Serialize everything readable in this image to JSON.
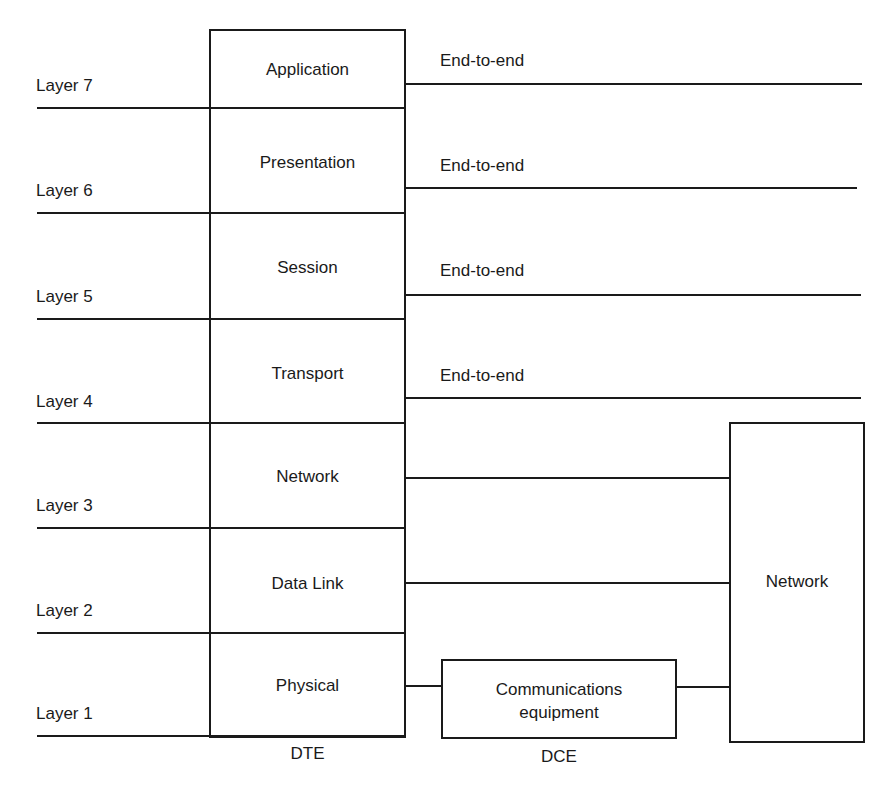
{
  "diagram": {
    "type": "OSI reference model",
    "dte": {
      "label": "DTE",
      "layers": [
        {
          "number": 7,
          "side_label": "Layer 7",
          "name": "Application",
          "connection": "End-to-end"
        },
        {
          "number": 6,
          "side_label": "Layer 6",
          "name": "Presentation",
          "connection": "End-to-end"
        },
        {
          "number": 5,
          "side_label": "Layer 5",
          "name": "Session",
          "connection": "End-to-end"
        },
        {
          "number": 4,
          "side_label": "Layer 4",
          "name": "Transport",
          "connection": "End-to-end"
        },
        {
          "number": 3,
          "side_label": "Layer 3",
          "name": "Network",
          "connection": "to Network"
        },
        {
          "number": 2,
          "side_label": "Layer 2",
          "name": "Data Link",
          "connection": "to Network"
        },
        {
          "number": 1,
          "side_label": "Layer 1",
          "name": "Physical",
          "connection": "via DCE to Network"
        }
      ]
    },
    "dce": {
      "label": "DCE",
      "box_line1": "Communications",
      "box_line2": "equipment"
    },
    "network_box": {
      "label": "Network"
    },
    "colors": {
      "line": "#1a1a1a",
      "background": "#ffffff"
    }
  }
}
